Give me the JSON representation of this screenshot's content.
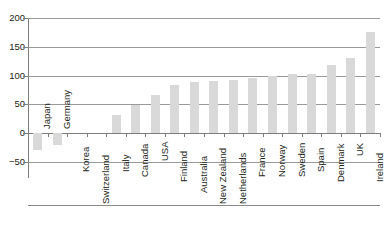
{
  "chart_data": {
    "type": "bar",
    "title": "",
    "xlabel": "",
    "ylabel": "",
    "ylim": [
      -50,
      200
    ],
    "yticks": [
      -50,
      0,
      50,
      100,
      150,
      200
    ],
    "ytick_labels": [
      "−50",
      "0",
      "50",
      "100",
      "150",
      "200"
    ],
    "grid": true,
    "legend": false,
    "bar_color": "#d9d9d9",
    "axis_color": "#7d7d7d",
    "grid_color": "#9a9a9a",
    "categories": [
      "Japan",
      "Germany",
      "Korea",
      "Switzerland",
      "Italy",
      "Canada",
      "USA",
      "Finland",
      "Australia",
      "New Zealand",
      "Netherlands",
      "France",
      "Norway",
      "Sweden",
      "Spain",
      "Denmark",
      "UK",
      "Ireland"
    ],
    "values": [
      -29,
      -21,
      0,
      0,
      31,
      49,
      66,
      84,
      89,
      91,
      92,
      96,
      99,
      103,
      103,
      119,
      131,
      176
    ],
    "series": [
      {
        "name": "",
        "values": [
          -29,
          -21,
          0,
          0,
          31,
          49,
          66,
          84,
          89,
          91,
          92,
          96,
          99,
          103,
          103,
          119,
          131,
          176
        ]
      }
    ]
  },
  "title_strip": {
    "text": ""
  }
}
